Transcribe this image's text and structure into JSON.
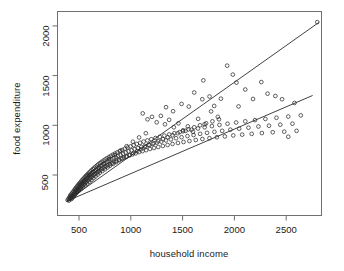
{
  "chart_data": {
    "type": "scatter",
    "title": "",
    "xlabel": "household income",
    "ylabel": "food expenditure",
    "xlim": [
      330,
      2870
    ],
    "ylim": [
      205,
      2120
    ],
    "xticks": [
      500,
      1000,
      1500,
      2000,
      2500
    ],
    "xtick_labels": [
      "500",
      "1000",
      "1500",
      "2000",
      "2500"
    ],
    "yticks": [
      500,
      1000,
      1500,
      2000
    ],
    "ytick_labels": [
      "500",
      "1000",
      "1500",
      "2000"
    ],
    "grid": false,
    "legend": "none",
    "marker": "open-circle",
    "marker_color": "#2b2b2b",
    "line_color": "#2b2b2b",
    "points": [
      [
        390,
        248
      ],
      [
        398,
        262
      ],
      [
        404,
        243
      ],
      [
        408,
        276
      ],
      [
        412,
        258
      ],
      [
        415,
        290
      ],
      [
        418,
        268
      ],
      [
        421,
        302
      ],
      [
        424,
        281
      ],
      [
        427,
        258
      ],
      [
        430,
        312
      ],
      [
        433,
        292
      ],
      [
        436,
        270
      ],
      [
        439,
        325
      ],
      [
        442,
        300
      ],
      [
        445,
        282
      ],
      [
        448,
        338
      ],
      [
        451,
        315
      ],
      [
        454,
        292
      ],
      [
        457,
        352
      ],
      [
        460,
        327
      ],
      [
        462,
        305
      ],
      [
        465,
        362
      ],
      [
        468,
        340
      ],
      [
        470,
        318
      ],
      [
        473,
        374
      ],
      [
        476,
        352
      ],
      [
        479,
        330
      ],
      [
        482,
        386
      ],
      [
        485,
        362
      ],
      [
        488,
        340
      ],
      [
        491,
        398
      ],
      [
        494,
        372
      ],
      [
        497,
        350
      ],
      [
        500,
        410
      ],
      [
        503,
        384
      ],
      [
        506,
        360
      ],
      [
        509,
        420
      ],
      [
        512,
        396
      ],
      [
        515,
        372
      ],
      [
        518,
        432
      ],
      [
        521,
        406
      ],
      [
        524,
        382
      ],
      [
        527,
        444
      ],
      [
        530,
        418
      ],
      [
        533,
        392
      ],
      [
        536,
        455
      ],
      [
        540,
        428
      ],
      [
        543,
        402
      ],
      [
        546,
        466
      ],
      [
        549,
        440
      ],
      [
        552,
        412
      ],
      [
        556,
        478
      ],
      [
        559,
        450
      ],
      [
        562,
        424
      ],
      [
        566,
        490
      ],
      [
        569,
        462
      ],
      [
        572,
        434
      ],
      [
        576,
        500
      ],
      [
        580,
        472
      ],
      [
        583,
        445
      ],
      [
        587,
        512
      ],
      [
        590,
        484
      ],
      [
        594,
        456
      ],
      [
        598,
        524
      ],
      [
        602,
        494
      ],
      [
        606,
        466
      ],
      [
        610,
        536
      ],
      [
        614,
        506
      ],
      [
        618,
        478
      ],
      [
        622,
        548
      ],
      [
        626,
        518
      ],
      [
        630,
        488
      ],
      [
        634,
        560
      ],
      [
        638,
        530
      ],
      [
        642,
        500
      ],
      [
        647,
        572
      ],
      [
        651,
        540
      ],
      [
        655,
        510
      ],
      [
        660,
        584
      ],
      [
        664,
        552
      ],
      [
        669,
        522
      ],
      [
        674,
        596
      ],
      [
        678,
        564
      ],
      [
        683,
        532
      ],
      [
        688,
        608
      ],
      [
        693,
        576
      ],
      [
        698,
        544
      ],
      [
        703,
        620
      ],
      [
        708,
        588
      ],
      [
        713,
        556
      ],
      [
        718,
        632
      ],
      [
        724,
        598
      ],
      [
        729,
        566
      ],
      [
        735,
        644
      ],
      [
        740,
        610
      ],
      [
        746,
        578
      ],
      [
        752,
        656
      ],
      [
        757,
        622
      ],
      [
        763,
        588
      ],
      [
        769,
        668
      ],
      [
        775,
        634
      ],
      [
        781,
        600
      ],
      [
        788,
        680
      ],
      [
        794,
        644
      ],
      [
        800,
        610
      ],
      [
        807,
        692
      ],
      [
        813,
        658
      ],
      [
        820,
        620
      ],
      [
        827,
        704
      ],
      [
        834,
        668
      ],
      [
        841,
        632
      ],
      [
        848,
        716
      ],
      [
        855,
        680
      ],
      [
        862,
        642
      ],
      [
        870,
        728
      ],
      [
        877,
        692
      ],
      [
        885,
        654
      ],
      [
        893,
        740
      ],
      [
        901,
        702
      ],
      [
        909,
        664
      ],
      [
        917,
        752
      ],
      [
        925,
        714
      ],
      [
        934,
        676
      ],
      [
        942,
        764
      ],
      [
        951,
        726
      ],
      [
        960,
        686
      ],
      [
        969,
        776
      ],
      [
        978,
        738
      ],
      [
        988,
        698
      ],
      [
        997,
        788
      ],
      [
        1007,
        748
      ],
      [
        1017,
        708
      ],
      [
        1027,
        800
      ],
      [
        1037,
        760
      ],
      [
        1047,
        718
      ],
      [
        1058,
        812
      ],
      [
        1068,
        770
      ],
      [
        1079,
        730
      ],
      [
        1090,
        824
      ],
      [
        1101,
        782
      ],
      [
        1113,
        740
      ],
      [
        1124,
        836
      ],
      [
        1136,
        792
      ],
      [
        1148,
        750
      ],
      [
        1160,
        848
      ],
      [
        1172,
        804
      ],
      [
        1185,
        762
      ],
      [
        1198,
        860
      ],
      [
        1211,
        814
      ],
      [
        1224,
        772
      ],
      [
        1238,
        872
      ],
      [
        1251,
        826
      ],
      [
        1265,
        782
      ],
      [
        1280,
        884
      ],
      [
        1294,
        836
      ],
      [
        1309,
        792
      ],
      [
        1324,
        896
      ],
      [
        1339,
        848
      ],
      [
        1355,
        802
      ],
      [
        1371,
        908
      ],
      [
        1387,
        858
      ],
      [
        1403,
        812
      ],
      [
        1420,
        920
      ],
      [
        1437,
        870
      ],
      [
        1455,
        822
      ],
      [
        1472,
        932
      ],
      [
        1490,
        880
      ],
      [
        1509,
        832
      ],
      [
        1528,
        944
      ],
      [
        1547,
        892
      ],
      [
        1566,
        842
      ],
      [
        1586,
        956
      ],
      [
        1606,
        902
      ],
      [
        1627,
        852
      ],
      [
        1648,
        968
      ],
      [
        1669,
        914
      ],
      [
        1691,
        862
      ],
      [
        1713,
        980
      ],
      [
        1736,
        924
      ],
      [
        1759,
        870
      ],
      [
        1783,
        992
      ],
      [
        1807,
        934
      ],
      [
        1831,
        880
      ],
      [
        1856,
        1004
      ],
      [
        1882,
        944
      ],
      [
        1908,
        888
      ],
      [
        1934,
        1016
      ],
      [
        1961,
        956
      ],
      [
        1989,
        898
      ],
      [
        2017,
        1028
      ],
      [
        2046,
        966
      ],
      [
        2075,
        906
      ],
      [
        2105,
        1040
      ],
      [
        2136,
        976
      ],
      [
        2167,
        914
      ],
      [
        2199,
        1052
      ],
      [
        2232,
        988
      ],
      [
        2265,
        922
      ],
      [
        2299,
        1064
      ],
      [
        2334,
        996
      ],
      [
        2370,
        930
      ],
      [
        2406,
        1076
      ],
      [
        2443,
        1006
      ],
      [
        2481,
        936
      ],
      [
        2520,
        1088
      ],
      [
        2560,
        1016
      ],
      [
        2600,
        944
      ],
      [
        2641,
        1100
      ],
      [
        420,
        270
      ],
      [
        440,
        288
      ],
      [
        460,
        306
      ],
      [
        480,
        324
      ],
      [
        500,
        342
      ],
      [
        520,
        360
      ],
      [
        540,
        378
      ],
      [
        560,
        396
      ],
      [
        580,
        414
      ],
      [
        600,
        432
      ],
      [
        620,
        450
      ],
      [
        640,
        468
      ],
      [
        660,
        486
      ],
      [
        680,
        504
      ],
      [
        700,
        522
      ],
      [
        725,
        540
      ],
      [
        750,
        558
      ],
      [
        775,
        576
      ],
      [
        800,
        594
      ],
      [
        830,
        612
      ],
      [
        860,
        630
      ],
      [
        890,
        648
      ],
      [
        920,
        666
      ],
      [
        955,
        684
      ],
      [
        990,
        702
      ],
      [
        1025,
        720
      ],
      [
        1062,
        740
      ],
      [
        1100,
        760
      ],
      [
        1140,
        780
      ],
      [
        1180,
        800
      ],
      [
        1222,
        820
      ],
      [
        1265,
        840
      ],
      [
        1310,
        860
      ],
      [
        1356,
        880
      ],
      [
        1404,
        900
      ],
      [
        1453,
        920
      ],
      [
        1504,
        940
      ],
      [
        1557,
        960
      ],
      [
        1612,
        980
      ],
      [
        1668,
        1000
      ],
      [
        1727,
        1020
      ],
      [
        1788,
        1040
      ],
      [
        1851,
        1060
      ],
      [
        1340,
        1182
      ],
      [
        1408,
        1142
      ],
      [
        1490,
        1215
      ],
      [
        1560,
        1188
      ],
      [
        1612,
        1330
      ],
      [
        1690,
        1262
      ],
      [
        1700,
        1452
      ],
      [
        1760,
        1290
      ],
      [
        1805,
        1195
      ],
      [
        1870,
        1268
      ],
      [
        1930,
        1600
      ],
      [
        1985,
        1510
      ],
      [
        2020,
        1430
      ],
      [
        2040,
        1190
      ],
      [
        2105,
        1360
      ],
      [
        2180,
        1265
      ],
      [
        2260,
        1435
      ],
      [
        2320,
        1318
      ],
      [
        2395,
        1295
      ],
      [
        2460,
        1262
      ],
      [
        2520,
        885
      ],
      [
        2580,
        1225
      ],
      [
        2800,
        2038
      ],
      [
        1115,
        1120
      ],
      [
        1162,
        1060
      ],
      [
        1205,
        1085
      ],
      [
        1250,
        1030
      ],
      [
        1290,
        1095
      ],
      [
        1330,
        1010
      ],
      [
        1370,
        1055
      ],
      [
        1415,
        980
      ],
      [
        1460,
        1020
      ],
      [
        1505,
        950
      ],
      [
        1550,
        990
      ],
      [
        1600,
        935
      ],
      [
        1650,
        1065
      ],
      [
        1712,
        1010
      ],
      [
        1775,
        1140
      ],
      [
        1840,
        1085
      ],
      [
        600,
        500
      ],
      [
        640,
        530
      ],
      [
        690,
        570
      ],
      [
        740,
        615
      ],
      [
        790,
        660
      ],
      [
        845,
        700
      ],
      [
        900,
        745
      ],
      [
        960,
        790
      ],
      [
        1020,
        835
      ],
      [
        1080,
        878
      ],
      [
        1145,
        920
      ]
    ],
    "lines": [
      {
        "name": "upper-fit-line",
        "x1": 380,
        "y1": 236,
        "x2": 2815,
        "y2": 2035
      },
      {
        "name": "lower-fit-line",
        "x1": 380,
        "y1": 236,
        "x2": 2755,
        "y2": 1300
      }
    ]
  }
}
